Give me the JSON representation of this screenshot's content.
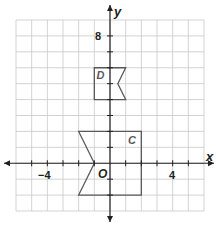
{
  "diagram": {
    "type": "coordinate-plane",
    "grid": {
      "xmin": -6,
      "xmax": 6,
      "ymin": -3,
      "ymax": 9,
      "step": 1
    },
    "axes": {
      "x_label": "x",
      "y_label": "y",
      "origin_label": "O"
    },
    "tick_labels": {
      "x_neg4": "−4",
      "x_4": "4",
      "y_8": "8"
    },
    "shapes": [
      {
        "name": "D",
        "label": "D",
        "vertices": [
          [
            -1,
            6
          ],
          [
            1,
            6
          ],
          [
            0.5,
            5
          ],
          [
            1,
            4
          ],
          [
            -1,
            4
          ]
        ],
        "label_pos": [
          -0.6,
          5.5
        ]
      },
      {
        "name": "C",
        "label": "C",
        "vertices": [
          [
            -2,
            2
          ],
          [
            2,
            2
          ],
          [
            2,
            -2
          ],
          [
            -2,
            -2
          ],
          [
            -1,
            0
          ]
        ],
        "label_pos": [
          1.4,
          1.4
        ]
      }
    ],
    "colors": {
      "grid": "#c8c8c8",
      "axis": "#231f20",
      "shape_stroke": "#58595b",
      "text": "#231f20"
    }
  }
}
